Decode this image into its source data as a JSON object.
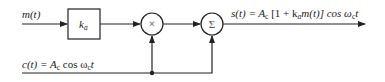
{
  "diagram": {
    "input": {
      "label": "m(t)"
    },
    "gain_block": {
      "label": "k",
      "subscript": "a"
    },
    "multiplier": {
      "symbol": "×"
    },
    "adder": {
      "symbol": "Σ"
    },
    "carrier": {
      "label_prefix": "c(t) = A",
      "label_sub": "c",
      "label_mid": " cos ω",
      "label_sub2": "c",
      "label_tail": "t"
    },
    "output": {
      "part1": "s(t) = A",
      "sub1": "c",
      "part2": " [1 + k",
      "sub2": "a",
      "part3": "m(t)] cos ω",
      "sub3": "c",
      "part4": "t"
    },
    "colors": {
      "line": "#222222",
      "background": "#ffffff"
    }
  }
}
